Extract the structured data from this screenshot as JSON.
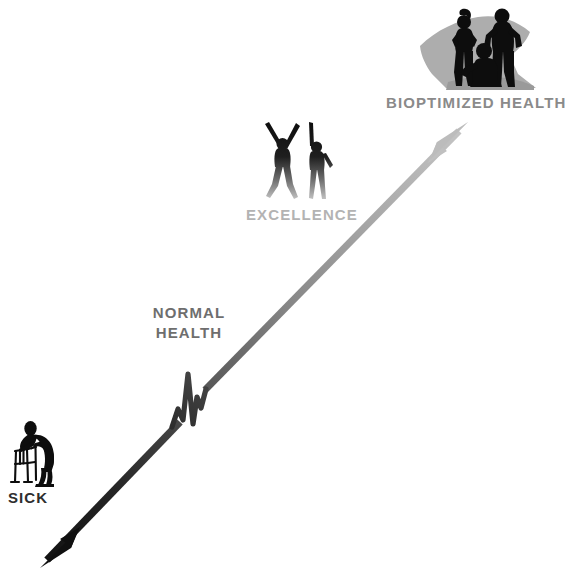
{
  "document": {
    "title": "BECOME BIOPTIMIZED - OR WHATEVER",
    "type": "health-continuum-infographic",
    "background_color": "#ffffff"
  },
  "labels": {
    "sick": "SICK",
    "normal_health_line1": "NORMAL",
    "normal_health_line2": "HEALTH",
    "excellence": "EXCELLENCE",
    "bioptimized": "BIOPTIMIZED HEALTH"
  },
  "colors": {
    "sick_text": "#2e2e2e",
    "normal_text": "#6e6e6e",
    "excellence_text": "#b3b3b3",
    "bioptimized_text": "#8a8a8a",
    "arrow_dark": "#151515",
    "arrow_mid": "#7a7a7a",
    "arrow_light": "#bdbdbd",
    "silhouette_dark": "#0d0d0d",
    "silhouette_shadow": "#a8a8a8"
  },
  "arrow": {
    "description": "Diagonal double-headed gradient arrow from lower-left (sick) to upper-right (bioptimized health), with an EKG heartbeat squiggle at the normal-health midpoint",
    "tail_point": "40,568",
    "head_point": "468,122",
    "gradient_from": "#151515",
    "gradient_to": "#c2c2c2"
  },
  "figures": [
    {
      "name": "sick-person-with-walker",
      "stage": "SICK",
      "position": "lower-left",
      "tone": "solid black"
    },
    {
      "name": "two-people-arms-raised",
      "stage": "EXCELLENCE",
      "position": "center",
      "tone": "black fading to gray"
    },
    {
      "name": "group-of-three-athletes",
      "stage": "BIOPTIMIZED HEALTH",
      "position": "upper-right",
      "tone": "black with gray shadow"
    }
  ]
}
